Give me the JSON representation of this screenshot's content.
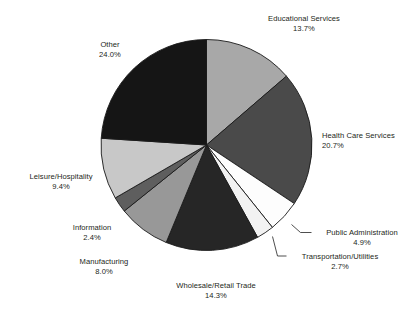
{
  "chart_data": {
    "type": "pie",
    "title": "",
    "xlabel": "",
    "ylabel": "",
    "legend_position": "none",
    "grid": false,
    "start_angle_deg": 0,
    "direction": "clockwise",
    "units": "percent",
    "categories": [
      "Educational Services",
      "Health Care Services",
      "Public Administration",
      "Transportation/Utilities",
      "Wholesale/Retail Trade",
      "Manufacturing",
      "Information",
      "Leisure/Hospitality",
      "Other"
    ],
    "values": [
      13.7,
      20.7,
      4.9,
      2.7,
      14.3,
      8.0,
      2.4,
      9.4,
      24.0
    ],
    "slices": [
      {
        "label": "Educational Services",
        "value": 13.7,
        "value_text": "13.7%",
        "color": "#a8a8a8",
        "label_align": "center"
      },
      {
        "label": "Health Care Services",
        "value": 20.7,
        "value_text": "20.7%",
        "color": "#4a4a4a",
        "label_align": "left"
      },
      {
        "label": "Public Administration",
        "value": 4.9,
        "value_text": "4.9%",
        "color": "#fdfdfd",
        "label_align": "center"
      },
      {
        "label": "Transportation/Utilities",
        "value": 2.7,
        "value_text": "2.7%",
        "color": "#f2f2f2",
        "label_align": "center"
      },
      {
        "label": "Wholesale/Retail Trade",
        "value": 14.3,
        "value_text": "14.3%",
        "color": "#262626",
        "label_align": "center"
      },
      {
        "label": "Manufacturing",
        "value": 8.0,
        "value_text": "8.0%",
        "color": "#989898",
        "label_align": "center"
      },
      {
        "label": "Information",
        "value": 2.4,
        "value_text": "2.4%",
        "color": "#5e5e5e",
        "label_align": "center"
      },
      {
        "label": "Leisure/Hospitality",
        "value": 9.4,
        "value_text": "9.4%",
        "color": "#c8c8c8",
        "label_align": "center"
      },
      {
        "label": "Other",
        "value": 24.0,
        "value_text": "24.0%",
        "color": "#151515",
        "label_align": "center"
      }
    ],
    "colors": {
      "outline": "#1a1a1a",
      "text": "#231f20",
      "background": "#ffffff",
      "leader_line": "#3a3a3a"
    }
  }
}
